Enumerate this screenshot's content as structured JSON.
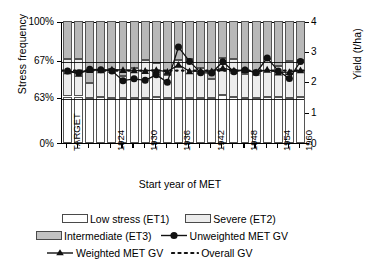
{
  "chart_data": {
    "type": "bar",
    "title": "",
    "subtitle": "",
    "xlabel": "Start year of MET",
    "ylabel": "Stress frequency",
    "ylabel_right": "Yield (t/ha)",
    "grid": true,
    "legend_position": "bottom",
    "yticks_left": [
      "0%",
      "63%",
      "67%",
      "100%"
    ],
    "yticks_right": [
      "0",
      "1",
      "2",
      "3",
      "4"
    ],
    "ylim_right": [
      0,
      4
    ],
    "categories": [
      "TARGET",
      "1921",
      "1922",
      "1923",
      "1924",
      "1925",
      "1926",
      "1927",
      "1928",
      "1929",
      "1930",
      "1931",
      "1932",
      "1933",
      "1934",
      "1935",
      "1936",
      "1937",
      "1938",
      "1939",
      "1940",
      "1941"
    ],
    "xtick_labels": [
      "TARGET",
      "1924",
      "1930",
      "1936",
      "1942",
      "1948",
      "1954",
      "1960",
      "1966"
    ],
    "series": [
      {
        "name": "Low stress (ET1)",
        "type": "bar-segment",
        "color": "#ffffff",
        "values": [
          63.0,
          63.0,
          61.6,
          62.0,
          61.3,
          60.8,
          61.0,
          61.2,
          62.0,
          61.5,
          60.9,
          60.9,
          60.9,
          60.9,
          63.2,
          62.1,
          61.0,
          61.0,
          61.8,
          61.8,
          61.4,
          62.1
        ]
      },
      {
        "name": "Severe (ET2)",
        "type": "bar-segment",
        "color": "#ececec",
        "values": [
          67.5,
          67.1,
          64.5,
          65.9,
          66.0,
          65.2,
          66.1,
          67.0,
          66.6,
          65.3,
          66.9,
          67.3,
          66.1,
          64.9,
          68.4,
          67.7,
          65.4,
          65.5,
          67.1,
          66.3,
          66.8,
          67.0
        ]
      },
      {
        "name": "Intermediate (ET3)",
        "type": "bar-segment",
        "color": "#b8b8b8",
        "values": [
          100,
          100,
          100,
          100,
          100,
          100,
          100,
          100,
          100,
          100,
          100,
          100,
          100,
          100,
          100,
          100,
          100,
          100,
          100,
          100,
          100,
          100
        ]
      },
      {
        "name": "Unweighted MET GV",
        "type": "line-marker",
        "marker": "circle",
        "color": "#111111",
        "values": [
          2.43,
          2.37,
          2.48,
          2.47,
          2.43,
          2.11,
          2.17,
          2.12,
          2.3,
          2.06,
          3.21,
          2.74,
          2.37,
          2.36,
          2.73,
          2.4,
          2.46,
          2.37,
          2.85,
          2.43,
          2.18,
          2.74
        ]
      },
      {
        "name": "Weighted MET GV",
        "type": "line-marker",
        "marker": "triangle",
        "color": "#111111",
        "values": [
          2.42,
          2.34,
          2.46,
          2.45,
          2.47,
          2.46,
          2.45,
          2.43,
          2.46,
          2.4,
          2.63,
          2.42,
          2.42,
          2.42,
          2.52,
          2.44,
          2.46,
          2.38,
          2.47,
          2.38,
          2.39,
          2.45
        ]
      },
      {
        "name": "Overall GV",
        "type": "reference-line",
        "style": "dotted",
        "color": "#111111",
        "value": 2.44
      }
    ]
  },
  "axes": {
    "left_title": "Stress frequency",
    "right_title": "Yield (t/ha)",
    "bottom_title": "Start year of MET"
  },
  "legend": {
    "row1": [
      {
        "label": "Low stress (ET1)",
        "swatch": "et1-swatch"
      },
      {
        "label": "Severe (ET2)",
        "swatch": "et2-swatch"
      }
    ],
    "row2": [
      {
        "label": "Intermediate (ET3)",
        "swatch": "et3-swatch"
      },
      {
        "label": "Unweighted MET GV",
        "swatch": "circle-marker"
      }
    ],
    "row3": [
      {
        "label": "Weighted MET GV",
        "swatch": "triangle-marker"
      },
      {
        "label": "Overall GV",
        "swatch": "dotted-line"
      }
    ]
  }
}
